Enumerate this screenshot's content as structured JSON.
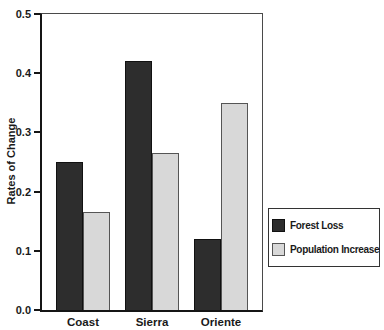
{
  "chart_data": {
    "type": "bar",
    "title": "",
    "xlabel": "",
    "ylabel": "Rates of Change",
    "ylim": [
      0,
      0.5
    ],
    "yticks": [
      "0.0",
      "0.1",
      "0.2",
      "0.3",
      "0.4",
      "0.5"
    ],
    "grid": false,
    "legend_position": "right-middle",
    "categories": [
      "Coast",
      "Sierra",
      "Oriente"
    ],
    "series": [
      {
        "name": "Forest Loss",
        "color": "#2d2d2d",
        "border_color": "#111111",
        "values": [
          0.25,
          0.165,
          0.12
        ]
      },
      {
        "name": "Population Increase",
        "color": "#d8d8d8",
        "border_color": "#555555",
        "values": [
          0.165,
          0.265,
          0.35
        ]
      }
    ]
  },
  "note": "series order per category: Forest Loss values are [Coast 0.25, Sierra 0.42, Oriente 0.12]; Population Increase values are [Coast 0.165, Sierra 0.265, Oriente 0.35]",
  "series_values_fix": {
    "forest_loss": [
      0.25,
      0.42,
      0.12
    ],
    "population_increase": [
      0.165,
      0.265,
      0.35
    ]
  }
}
